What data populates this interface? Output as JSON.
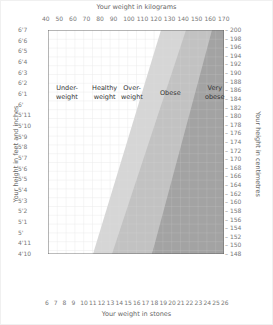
{
  "chart_data": {
    "type": "area",
    "title": "",
    "x_top_label": "Your weight in kilograms",
    "x_top_ticks": [
      40,
      50,
      60,
      70,
      80,
      90,
      100,
      110,
      120,
      130,
      140,
      150,
      160,
      170
    ],
    "x_bottom_label": "Your weight in stones",
    "x_bottom_ticks": [
      6,
      7,
      8,
      9,
      10,
      11,
      12,
      13,
      14,
      15,
      16,
      17,
      18,
      19,
      20,
      21,
      22,
      23,
      24,
      25,
      26
    ],
    "y_left_label": "Your height in feet and inches",
    "y_left_ticks": [
      "4'10",
      "4'11",
      "5'",
      "5'1",
      "5'2",
      "5'3",
      "5'4",
      "5'5",
      "5'6",
      "5'7",
      "5'8",
      "5'9",
      "5'10",
      "5'11",
      "6'",
      "6'1",
      "6'2",
      "6'3",
      "6'4",
      "6'5",
      "6'6",
      "6'7"
    ],
    "y_right_label": "Your height in centimetres",
    "y_right_ticks": [
      148,
      150,
      152,
      154,
      156,
      158,
      160,
      162,
      164,
      166,
      168,
      170,
      172,
      174,
      176,
      178,
      180,
      182,
      184,
      186,
      188,
      190,
      192,
      194,
      196,
      198,
      200
    ],
    "xlim_kg": [
      40,
      170
    ],
    "ylim_cm": [
      148,
      200
    ],
    "grid": true,
    "regions": [
      {
        "name": "Underweight",
        "label": "Under-\nweight",
        "bmi_range": [
          0,
          18.5
        ],
        "color": "#ffffff"
      },
      {
        "name": "Healthy weight",
        "label": "Healthy\nweight",
        "bmi_range": [
          18.5,
          25
        ],
        "color": "#ffffff"
      },
      {
        "name": "Overweight",
        "label": "Over-\nweight",
        "bmi_range": [
          25,
          30
        ],
        "color": "#d4d4d4"
      },
      {
        "name": "Obese",
        "label": "Obese",
        "bmi_range": [
          30,
          40
        ],
        "color": "#bdbdbd"
      },
      {
        "name": "Very obese",
        "label": "Very\nobese",
        "bmi_range": [
          40,
          100
        ],
        "color": "#9a9a9a"
      }
    ]
  },
  "labels": {
    "top": "Your weight in kilograms",
    "bottom": "Your weight in stones",
    "left": "Your height in feet and inches",
    "right": "Your height in centimetres",
    "underweight_1": "Under-",
    "underweight_2": "weight",
    "healthy_1": "Healthy",
    "healthy_2": "weight",
    "overweight_1": "Over-",
    "overweight_2": "weight",
    "obese": "Obese",
    "veryobese_1": "Very",
    "veryobese_2": "obese"
  }
}
